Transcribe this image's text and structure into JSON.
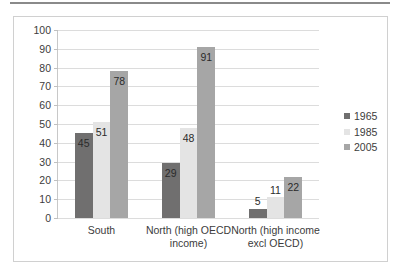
{
  "chart_data": {
    "type": "bar",
    "title": "",
    "subtitle": "",
    "xlabel": "",
    "ylabel": "",
    "categories": [
      "South",
      "North (high OECD income)",
      "North (high income excl OECD)"
    ],
    "series": [
      {
        "name": "1965",
        "color": "#706F6F",
        "values": [
          45,
          29,
          5
        ]
      },
      {
        "name": "1985",
        "color": "#E4E4E4",
        "values": [
          51,
          48,
          11
        ]
      },
      {
        "name": "2005",
        "color": "#A6A6A6",
        "values": [
          78,
          91,
          22
        ]
      }
    ],
    "ylim": [
      0,
      100
    ],
    "yticks": [
      0,
      10,
      20,
      30,
      40,
      50,
      60,
      70,
      80,
      90,
      100
    ],
    "ytick_labels": [
      "0",
      "10",
      "20",
      "30",
      "40",
      "50",
      "60",
      "70",
      "80",
      "90",
      "100"
    ],
    "grid": true,
    "legend_position": "right",
    "data_labels": true,
    "plot_background": "#FFFFFF",
    "gridline_color": "#DCDCDC",
    "border_color": "#D0D0D0"
  }
}
